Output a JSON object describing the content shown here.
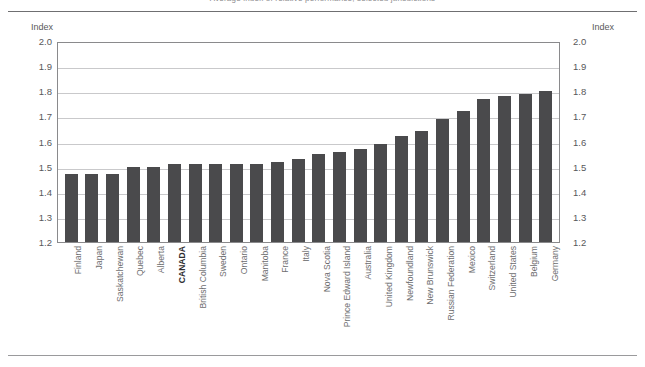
{
  "figure": {
    "clipped_header": "Average index of relative performance, selected jurisdictions",
    "axis_caption_left": "Index",
    "axis_caption_right": "Index",
    "bar_color": "#4a4a4c",
    "highlight_category": "CANADA"
  },
  "chart_data": {
    "type": "bar",
    "title": "",
    "xlabel": "",
    "ylabel": "Index",
    "ylim": [
      1.2,
      2.0
    ],
    "yticks": [
      "1.2",
      "1.3",
      "1.4",
      "1.5",
      "1.6",
      "1.7",
      "1.8",
      "1.9",
      "2.0"
    ],
    "grid": true,
    "legend": "none",
    "categories": [
      "Finland",
      "Japan",
      "Saskatchewan",
      "Quebec",
      "Alberta",
      "CANADA",
      "British Columbia",
      "Sweden",
      "Ontario",
      "Manitoba",
      "France",
      "Italy",
      "Nova Scotia",
      "Prince Edward Island",
      "Australia",
      "United Kingdom",
      "Newfoundland",
      "New Brunswick",
      "Russian Federation",
      "Mexico",
      "Switzerland",
      "United States",
      "Belgium",
      "Germany"
    ],
    "values": [
      1.47,
      1.47,
      1.47,
      1.5,
      1.5,
      1.51,
      1.51,
      1.51,
      1.51,
      1.51,
      1.52,
      1.53,
      1.55,
      1.56,
      1.57,
      1.59,
      1.62,
      1.64,
      1.69,
      1.72,
      1.77,
      1.78,
      1.79,
      1.8
    ]
  }
}
